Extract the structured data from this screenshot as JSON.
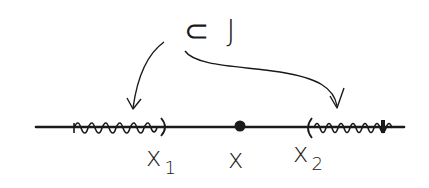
{
  "diagram": {
    "type": "number-line",
    "style": "hand-drawn",
    "set_label": "⊂ J",
    "points": {
      "x1": {
        "symbol": "x",
        "subscript": "1"
      },
      "x": {
        "symbol": "x",
        "subscript": ""
      },
      "x2": {
        "symbol": "x",
        "subscript": "2"
      }
    },
    "intervals": [
      {
        "name": "left-interval",
        "description": "squiggly-shaded interval ending at x1 with open paren ')'",
        "end_bracket": ")"
      },
      {
        "name": "right-interval",
        "description": "squiggly-shaded interval starting at x2 with open paren '('",
        "start_bracket": "("
      }
    ],
    "arrows": [
      {
        "from": "set-label",
        "to": "left-interval"
      },
      {
        "from": "set-label",
        "to": "right-interval"
      }
    ],
    "colors": {
      "ink": "#1a1a1a",
      "background": "#ffffff"
    }
  }
}
